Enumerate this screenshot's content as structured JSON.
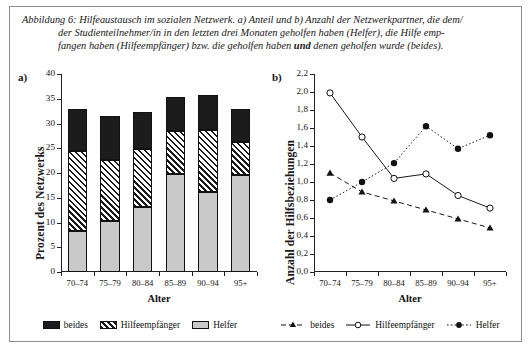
{
  "caption": {
    "line1": "Abbildung 6: Hilfeaustausch im sozialen Netzwerk. a) Anteil und b) Anzahl der Netzwerkpartner, die dem/",
    "line2": "der Studienteilnehmer/in in den letzten drei Monaten geholfen haben (Helfer), die Hilfe emp-",
    "line3_pre": "fangen haben (Hilfeempfänger) bzw. die geholfen haben ",
    "line3_bold": "und",
    "line3_post": " denen geholfen wurde (beides)."
  },
  "panel_a": {
    "letter": "a)",
    "ylabel": "Prozent des Netzwerks",
    "xlabel": "Alter",
    "legend": [
      {
        "key": "beides",
        "label": "beides"
      },
      {
        "key": "hilfeempfaenger",
        "label": "Hilfeempfänger"
      },
      {
        "key": "helfer",
        "label": "Helfer"
      }
    ]
  },
  "panel_b": {
    "letter": "b)",
    "ylabel": "Anzahl der Hilfsbeziehungen",
    "xlabel": "Alter",
    "legend": [
      {
        "key": "beides",
        "label": "beides"
      },
      {
        "key": "hilfeempfaenger",
        "label": "Hilfeempfänger"
      },
      {
        "key": "helfer",
        "label": "Helfer"
      }
    ]
  },
  "chart_data": [
    {
      "id": "panel_a",
      "type": "bar",
      "stacked": true,
      "title": "",
      "xlabel": "Alter",
      "ylabel": "Prozent des Netzwerks",
      "categories": [
        "70–74",
        "75–79",
        "80–84",
        "85–89",
        "90–94",
        "95+"
      ],
      "ylim": [
        0,
        40
      ],
      "yticks": [
        0,
        5,
        10,
        15,
        20,
        25,
        30,
        35,
        40
      ],
      "ytick_labels": [
        "0",
        "5",
        "10",
        "15",
        "20",
        "25",
        "30",
        "35",
        "40"
      ],
      "grid": false,
      "legend_position": "bottom",
      "series": [
        {
          "name": "Helfer",
          "fill": "solid-light-gray",
          "values": [
            8.2,
            10.4,
            13.2,
            19.8,
            16.1,
            19.7
          ]
        },
        {
          "name": "Hilfeempfänger",
          "fill": "diagonal-hatch",
          "values": [
            16.2,
            12.3,
            11.7,
            8.7,
            12.5,
            6.6
          ]
        },
        {
          "name": "beides",
          "fill": "solid-black",
          "values": [
            8.6,
            8.8,
            7.5,
            6.9,
            7.2,
            6.6
          ]
        }
      ],
      "totals": [
        33.0,
        31.5,
        32.4,
        35.4,
        35.8,
        32.9
      ]
    },
    {
      "id": "panel_b",
      "type": "line",
      "title": "",
      "xlabel": "Alter",
      "ylabel": "Anzahl der Hilfsbeziehungen",
      "categories": [
        "70–74",
        "75–79",
        "80–84",
        "85–89",
        "90–94",
        "95+"
      ],
      "ylim": [
        0.0,
        2.2
      ],
      "yticks": [
        0.0,
        0.2,
        0.4,
        0.6,
        0.8,
        1.0,
        1.2,
        1.4,
        1.6,
        1.8,
        2.0,
        2.2
      ],
      "ytick_labels": [
        "0,0",
        "0,2",
        "0,4",
        "0,6",
        "0,8",
        "1,0",
        "1,2",
        "1,4",
        "1,6",
        "1,8",
        "2,0",
        "2,2"
      ],
      "grid": false,
      "legend_position": "bottom",
      "series": [
        {
          "name": "beides",
          "marker": "filled-triangle",
          "line": "dashed",
          "values": [
            1.1,
            0.89,
            0.79,
            0.69,
            0.59,
            0.49
          ]
        },
        {
          "name": "Hilfeempfänger",
          "marker": "open-circle",
          "line": "solid",
          "values": [
            1.99,
            1.5,
            1.04,
            1.09,
            0.85,
            0.71
          ]
        },
        {
          "name": "Helfer",
          "marker": "filled-circle",
          "line": "dotted",
          "values": [
            0.8,
            1.0,
            1.21,
            1.62,
            1.37,
            1.52
          ]
        }
      ]
    }
  ]
}
